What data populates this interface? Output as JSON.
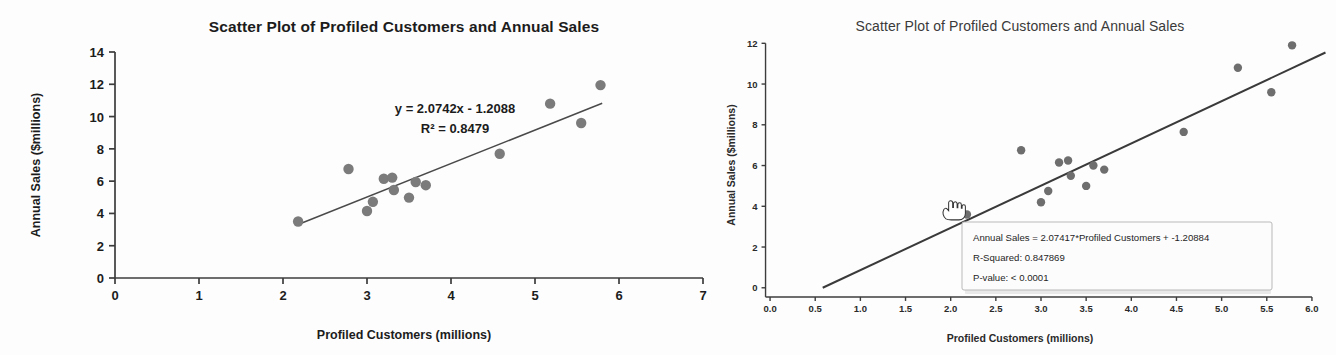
{
  "page": {
    "background": "#fdfdfd",
    "ink": "#2b2b2b"
  },
  "left_panel": {
    "title": "Scatter Plot of Profiled Customers and Annual Sales",
    "equation_line1": "y = 2.0742x - 1.2088",
    "equation_line2": "R² = 0.8479"
  },
  "right_panel": {
    "title": "Scatter Plot of Profiled Customers and Annual Sales",
    "cursor_icon": "pointing-hand-cursor",
    "tooltip": {
      "line1": "Annual Sales = 2.07417*Profiled Customers + -1.20884",
      "line2": "R-Squared: 0.847869",
      "line3": "P-value: < 0.0001"
    }
  },
  "chart_data": [
    {
      "id": "left-scatter",
      "type": "scatter",
      "title": "Scatter Plot of Profiled Customers and Annual Sales",
      "xlabel": "Profiled Customers (millions)",
      "ylabel": "Annual Sales ($millions)",
      "xlim": [
        0,
        7
      ],
      "ylim": [
        0,
        14
      ],
      "xticks": [
        0,
        1,
        2,
        3,
        4,
        5,
        6,
        7
      ],
      "xtick_labels": [
        "0",
        "1",
        "2",
        "3",
        "4",
        "5",
        "6",
        "7"
      ],
      "yticks": [
        0,
        2,
        4,
        6,
        8,
        10,
        12,
        14
      ],
      "ytick_labels": [
        "0",
        "2",
        "4",
        "6",
        "8",
        "10",
        "12",
        "14"
      ],
      "grid": false,
      "legend": "none",
      "marker_color": "#7b7b7b",
      "line_color": "#4a4a4a",
      "annotations": [
        "y = 2.0742x - 1.2088",
        "R² = 0.8479"
      ],
      "trendline": {
        "slope": 2.0742,
        "intercept": -1.2088,
        "r_squared": 0.8479,
        "x_start": 2.18,
        "x_end": 5.8
      },
      "points": [
        {
          "x": 2.18,
          "y": 3.5
        },
        {
          "x": 2.78,
          "y": 6.75
        },
        {
          "x": 3.0,
          "y": 4.15
        },
        {
          "x": 3.07,
          "y": 4.72
        },
        {
          "x": 3.2,
          "y": 6.15
        },
        {
          "x": 3.3,
          "y": 6.22
        },
        {
          "x": 3.32,
          "y": 5.45
        },
        {
          "x": 3.5,
          "y": 4.98
        },
        {
          "x": 3.58,
          "y": 5.95
        },
        {
          "x": 3.7,
          "y": 5.75
        },
        {
          "x": 4.58,
          "y": 7.7
        },
        {
          "x": 5.18,
          "y": 10.8
        },
        {
          "x": 5.55,
          "y": 9.6
        },
        {
          "x": 5.78,
          "y": 11.95
        }
      ]
    },
    {
      "id": "right-scatter",
      "type": "scatter",
      "title": "Scatter Plot of Profiled Customers and Annual Sales",
      "xlabel": "Profiled Customers (millions)",
      "ylabel": "Annual Sales ($millions)",
      "xlim": [
        -0.2,
        6.2
      ],
      "ylim": [
        -0.6,
        12.8
      ],
      "xticks": [
        0.0,
        0.5,
        1.0,
        1.5,
        2.0,
        2.5,
        3.0,
        3.5,
        4.0,
        4.5,
        5.0,
        5.5,
        6.0
      ],
      "xtick_labels": [
        "0.0",
        "0.5",
        "1.0",
        "1.5",
        "2.0",
        "2.5",
        "3.0",
        "3.5",
        "4.0",
        "4.5",
        "5.0",
        "5.5",
        "6.0"
      ],
      "yticks": [
        0,
        2,
        4,
        6,
        8,
        10,
        12
      ],
      "ytick_labels": [
        "0",
        "2",
        "4",
        "6",
        "8",
        "10",
        "12"
      ],
      "grid": false,
      "legend": "none",
      "marker_color": "#6e6e6e",
      "line_color": "#3a3a3a",
      "trendline": {
        "slope": 2.07417,
        "intercept": -1.20884,
        "r_squared": 0.847869,
        "p_value": "< 0.0001",
        "x_start": 0.583,
        "x_end": 6.15
      },
      "points": [
        {
          "x": 2.18,
          "y": 3.6
        },
        {
          "x": 2.78,
          "y": 6.75
        },
        {
          "x": 3.0,
          "y": 4.2
        },
        {
          "x": 3.08,
          "y": 4.75
        },
        {
          "x": 3.2,
          "y": 6.15
        },
        {
          "x": 3.3,
          "y": 6.25
        },
        {
          "x": 3.33,
          "y": 5.5
        },
        {
          "x": 3.5,
          "y": 5.0
        },
        {
          "x": 3.58,
          "y": 6.0
        },
        {
          "x": 3.7,
          "y": 5.8
        },
        {
          "x": 4.58,
          "y": 7.65
        },
        {
          "x": 5.18,
          "y": 10.8
        },
        {
          "x": 5.55,
          "y": 9.6
        },
        {
          "x": 5.78,
          "y": 11.9
        }
      ]
    }
  ]
}
